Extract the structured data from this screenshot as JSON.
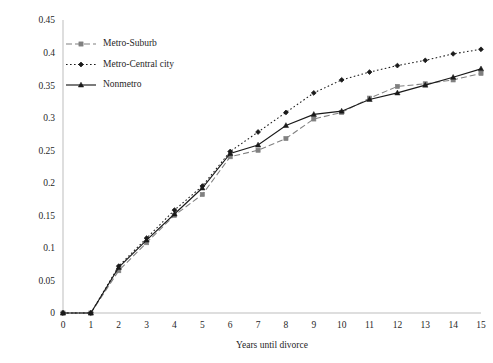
{
  "chart_data": {
    "type": "line",
    "title": "",
    "subtitle": "",
    "xlabel": "Years until divorce",
    "ylabel": "",
    "x": [
      0,
      1,
      2,
      3,
      4,
      5,
      6,
      7,
      8,
      9,
      10,
      11,
      12,
      13,
      14,
      15
    ],
    "xlim": [
      0,
      15
    ],
    "ylim": [
      0,
      0.45
    ],
    "xticks": [
      "0",
      "1",
      "2",
      "3",
      "4",
      "5",
      "6",
      "7",
      "8",
      "9",
      "10",
      "11",
      "12",
      "13",
      "14",
      "15"
    ],
    "yticks": [
      "0",
      "0.05",
      "0.1",
      "0.15",
      "0.2",
      "0.25",
      "0.3",
      "0.35",
      "0.4",
      "0.45"
    ],
    "ytick_values": [
      0,
      0.05,
      0.1,
      0.15,
      0.2,
      0.25,
      0.3,
      0.35,
      0.4,
      0.45
    ],
    "grid": false,
    "legend_position": "upper-left-inside",
    "series": [
      {
        "name": "Metro-Suburb",
        "color": "#808080",
        "line_style": "dashed",
        "marker": "square",
        "values": [
          0,
          0,
          0.065,
          0.108,
          0.15,
          0.182,
          0.24,
          0.25,
          0.268,
          0.298,
          0.308,
          0.33,
          0.348,
          0.352,
          0.358,
          0.368
        ]
      },
      {
        "name": "Metro-Central city",
        "color": "#1a1a1a",
        "line_style": "dotted",
        "marker": "diamond",
        "values": [
          0,
          0,
          0.072,
          0.115,
          0.158,
          0.195,
          0.248,
          0.278,
          0.308,
          0.338,
          0.358,
          0.37,
          0.38,
          0.388,
          0.398,
          0.405
        ]
      },
      {
        "name": "Nonmetro",
        "color": "#1a1a1a",
        "line_style": "solid",
        "marker": "triangle",
        "values": [
          0,
          0,
          0.07,
          0.112,
          0.152,
          0.192,
          0.245,
          0.258,
          0.288,
          0.305,
          0.31,
          0.328,
          0.338,
          0.35,
          0.362,
          0.375
        ]
      }
    ]
  }
}
